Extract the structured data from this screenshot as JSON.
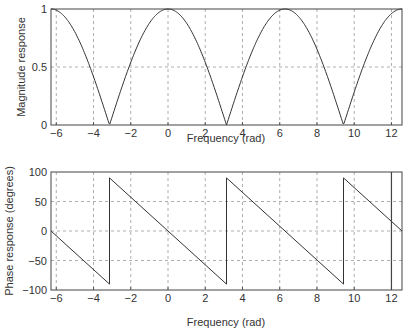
{
  "chart_data": [
    {
      "type": "line",
      "title": "",
      "xlabel": "Frequency (rad)",
      "ylabel": "Magnitude response",
      "xlim": [
        -6.2832,
        12.5664
      ],
      "ylim": [
        0,
        1
      ],
      "xticks": [
        -6,
        -4,
        -2,
        0,
        2,
        4,
        6,
        8,
        10,
        12
      ],
      "xtick_labels": [
        "−6",
        "−4",
        "−2",
        "0",
        "2",
        "4",
        "6",
        "8",
        "10",
        "12"
      ],
      "yticks": [
        0,
        0.5,
        1
      ],
      "ytick_labels": [
        "0",
        "0.5",
        "1"
      ],
      "grid": true,
      "series": [
        {
          "name": "|H(w)| = |cos(w/2)|",
          "x": [
            -6.2832,
            -5.5,
            -4.7124,
            -4.0,
            -3.1416,
            -2.0,
            -1.5708,
            -1.0,
            0,
            1.0,
            1.5708,
            2.0,
            3.1416,
            4.0,
            4.7124,
            5.5,
            6.2832,
            7.0,
            7.854,
            8.5,
            9.4248,
            10.5,
            10.9956,
            11.5,
            12.5664
          ],
          "y": [
            1.0,
            0.924,
            0.707,
            0.416,
            0.0,
            0.54,
            0.707,
            0.878,
            1.0,
            0.878,
            0.707,
            0.54,
            0.0,
            0.416,
            0.707,
            0.924,
            1.0,
            0.936,
            0.707,
            0.447,
            0.0,
            0.503,
            0.707,
            0.862,
            1.0
          ]
        }
      ]
    },
    {
      "type": "line",
      "title": "",
      "xlabel": "Frequency (rad)",
      "ylabel": "Phase response (degrees)",
      "xlim": [
        -6.2832,
        12.5664
      ],
      "ylim": [
        -100,
        100
      ],
      "xticks": [
        -6,
        -4,
        -2,
        0,
        2,
        4,
        6,
        8,
        10,
        12
      ],
      "xtick_labels": [
        "−6",
        "−4",
        "−2",
        "0",
        "2",
        "4",
        "6",
        "8",
        "10",
        "12"
      ],
      "yticks": [
        -100,
        -50,
        0,
        50,
        100
      ],
      "ytick_labels": [
        "−100",
        "−50",
        "0",
        "50",
        "100"
      ],
      "grid": true,
      "annotations": [
        {
          "type": "vertical-line",
          "x": 12.0
        }
      ],
      "series": [
        {
          "name": "phase (deg)",
          "x": [
            -6.2832,
            -3.1416,
            -3.1416,
            0,
            3.1416,
            3.1416,
            6.2832,
            9.4248,
            9.4248,
            12.5664
          ],
          "y": [
            0,
            -90,
            90,
            0,
            -90,
            90,
            0,
            -90,
            90,
            0
          ]
        }
      ]
    }
  ],
  "plots": {
    "top": {
      "ylabel": "Magnitude response",
      "xlabel": "Frequency (rad)"
    },
    "bottom": {
      "ylabel": "Phase response (degrees)",
      "xlabel": "Frequency (rad)"
    }
  }
}
